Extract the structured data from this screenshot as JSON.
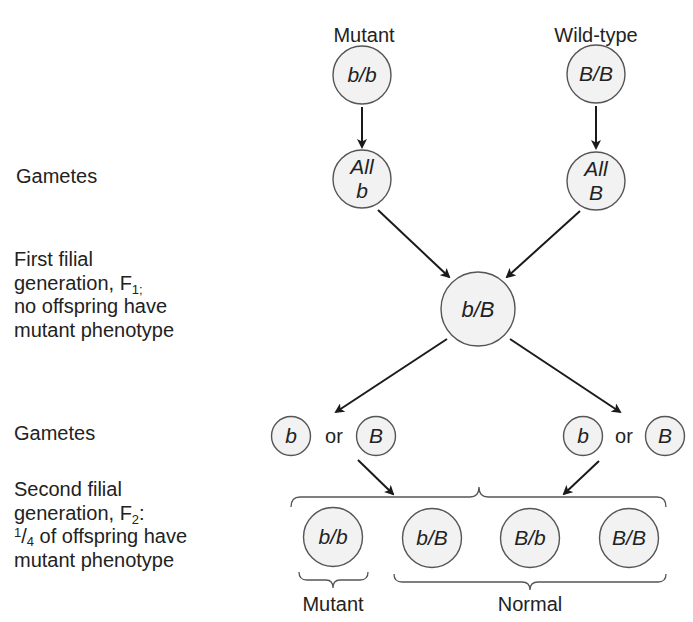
{
  "diagram": {
    "colors": {
      "circle_fill": "#f2f2f2",
      "circle_stroke": "#555555",
      "line": "#1a1a1a",
      "text": "#222222"
    },
    "parents": {
      "mutant": {
        "label": "Mutant",
        "genotype": "b/b"
      },
      "wild_type": {
        "label": "Wild-type",
        "genotype": "B/B"
      }
    },
    "parent_gametes": {
      "mutant": {
        "line1": "All",
        "line2": "b"
      },
      "wild_type": {
        "line1": "All",
        "line2": "B"
      }
    },
    "f1": {
      "genotype": "b/B"
    },
    "f1_gametes": {
      "left": {
        "first": "b",
        "connector": "or",
        "second": "B"
      },
      "right": {
        "first": "b",
        "connector": "or",
        "second": "B"
      }
    },
    "f2": {
      "genotypes": [
        "b/b",
        "b/B",
        "B/b",
        "B/B"
      ],
      "groups": {
        "mutant": "Mutant",
        "normal": "Normal"
      }
    }
  },
  "side_labels": {
    "gametes_1": "Gametes",
    "f1": {
      "line1": "First filial",
      "line2_prefix": "generation, F",
      "line2_sub": "1;",
      "line3": "no offspring have",
      "line4": "mutant phenotype"
    },
    "gametes_2": "Gametes",
    "f2": {
      "line1": "Second filial",
      "line2_prefix": "generation, F",
      "line2_sub": "2",
      "line2_suffix": ":",
      "line3_num": "1",
      "line3_slash": "/",
      "line3_den": "4",
      "line3_rest": " of offspring have",
      "line4": "mutant phenotype"
    }
  }
}
